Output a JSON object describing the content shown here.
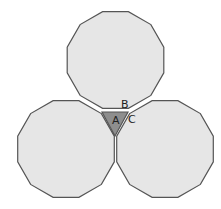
{
  "diagram": {
    "colors": {
      "background": "#ffffff",
      "polygon_fill": "#e6e6e6",
      "polygon_stroke": "#555555",
      "triangle_fill": "#8e8e8e"
    },
    "polygons": [
      {
        "name": "top-dodecagon",
        "sides": 12,
        "cx": 115.5,
        "cy": 60,
        "r": 50
      },
      {
        "name": "left-dodecagon",
        "sides": 12,
        "cx": 66,
        "cy": 149,
        "r": 50
      },
      {
        "name": "right-dodecagon",
        "sides": 12,
        "cx": 165,
        "cy": 149,
        "r": 50
      }
    ],
    "triangle": {
      "points": [
        [
          102,
          112
        ],
        [
          128,
          112
        ],
        [
          115,
          136
        ]
      ]
    },
    "labels": {
      "a": {
        "text": "A",
        "x": 112,
        "y": 124
      },
      "b": {
        "text": "B",
        "x": 121,
        "y": 108
      },
      "c": {
        "text": "C",
        "x": 128,
        "y": 123
      }
    }
  }
}
